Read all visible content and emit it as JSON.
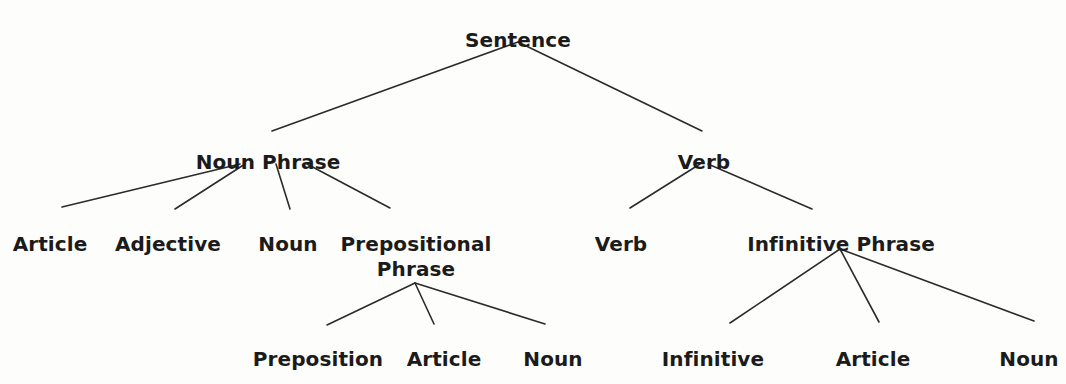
{
  "diagram": {
    "type": "syntax-parse-tree",
    "background_color": "#fdfdfb",
    "text_color": "#1b1b1b",
    "edge_color": "#2b2b2b",
    "edge_width": 1.6,
    "nodes": [
      {
        "id": "sentence",
        "label": "Sentence",
        "x": 518,
        "y": 28,
        "level": 0
      },
      {
        "id": "noun-phrase",
        "label": "Noun Phrase",
        "x": 268,
        "y": 150,
        "level": 1
      },
      {
        "id": "verb-top",
        "label": "Verb",
        "x": 704,
        "y": 150,
        "level": 1
      },
      {
        "id": "article-1",
        "label": "Article",
        "x": 50,
        "y": 232,
        "level": 2
      },
      {
        "id": "adjective-1",
        "label": "Adjective",
        "x": 168,
        "y": 232,
        "level": 2
      },
      {
        "id": "noun-1",
        "label": "Noun",
        "x": 288,
        "y": 232,
        "level": 2
      },
      {
        "id": "prepositional-phrase",
        "label": "Prepositional Phrase",
        "x": 416,
        "y": 232,
        "level": 2,
        "two_line": true
      },
      {
        "id": "verb-leaf",
        "label": "Verb",
        "x": 621,
        "y": 232,
        "level": 2
      },
      {
        "id": "infinitive-phrase",
        "label": "Infinitive Phrase",
        "x": 841,
        "y": 232,
        "level": 2
      },
      {
        "id": "preposition-1",
        "label": "Preposition",
        "x": 318,
        "y": 347,
        "level": 3
      },
      {
        "id": "article-2",
        "label": "Article",
        "x": 444,
        "y": 347,
        "level": 3
      },
      {
        "id": "noun-2",
        "label": "Noun",
        "x": 553,
        "y": 347,
        "level": 3
      },
      {
        "id": "infinitive-1",
        "label": "Infinitive",
        "x": 713,
        "y": 347,
        "level": 3
      },
      {
        "id": "article-3",
        "label": "Article",
        "x": 873,
        "y": 347,
        "level": 3
      },
      {
        "id": "noun-3",
        "label": "Noun",
        "x": 1029,
        "y": 347,
        "level": 3
      }
    ],
    "edges": [
      {
        "from": "sentence",
        "to": "noun-phrase",
        "x1": 518,
        "y1": 42,
        "x2": 272,
        "y2": 131
      },
      {
        "from": "sentence",
        "to": "verb-top",
        "x1": 518,
        "y1": 42,
        "x2": 702,
        "y2": 131
      },
      {
        "from": "noun-phrase",
        "to": "article-1",
        "x1": 240,
        "y1": 164,
        "x2": 62,
        "y2": 207
      },
      {
        "from": "noun-phrase",
        "to": "adjective-1",
        "x1": 245,
        "y1": 164,
        "x2": 175,
        "y2": 209
      },
      {
        "from": "noun-phrase",
        "to": "noun-1",
        "x1": 276,
        "y1": 164,
        "x2": 290,
        "y2": 209
      },
      {
        "from": "noun-phrase",
        "to": "prepositional-phrase",
        "x1": 307,
        "y1": 164,
        "x2": 390,
        "y2": 208
      },
      {
        "from": "verb-top",
        "to": "verb-leaf",
        "x1": 700,
        "y1": 164,
        "x2": 630,
        "y2": 208
      },
      {
        "from": "verb-top",
        "to": "infinitive-phrase",
        "x1": 708,
        "y1": 164,
        "x2": 812,
        "y2": 209
      },
      {
        "from": "prepositional-phrase",
        "to": "preposition-1",
        "x1": 415,
        "y1": 283,
        "x2": 327,
        "y2": 325
      },
      {
        "from": "prepositional-phrase",
        "to": "article-2",
        "x1": 415,
        "y1": 283,
        "x2": 434,
        "y2": 324
      },
      {
        "from": "prepositional-phrase",
        "to": "noun-2",
        "x1": 415,
        "y1": 283,
        "x2": 545,
        "y2": 324
      },
      {
        "from": "infinitive-phrase",
        "to": "infinitive-1",
        "x1": 840,
        "y1": 249,
        "x2": 730,
        "y2": 323
      },
      {
        "from": "infinitive-phrase",
        "to": "article-3",
        "x1": 840,
        "y1": 249,
        "x2": 879,
        "y2": 322
      },
      {
        "from": "infinitive-phrase",
        "to": "noun-3",
        "x1": 840,
        "y1": 249,
        "x2": 1034,
        "y2": 321
      }
    ]
  }
}
